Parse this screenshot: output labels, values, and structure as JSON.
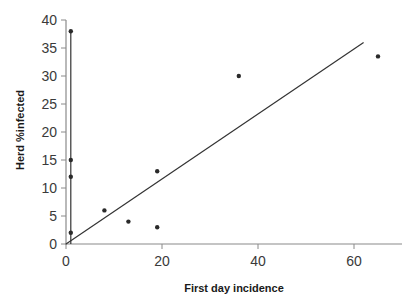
{
  "chart_data": {
    "type": "scatter",
    "title": "",
    "xlabel": "First day incidence",
    "ylabel": "Herd %infected",
    "xlim": [
      0,
      70
    ],
    "ylim": [
      0,
      40
    ],
    "xticks": [
      0,
      20,
      40,
      60
    ],
    "yticks": [
      0,
      5,
      10,
      15,
      20,
      25,
      30,
      35,
      40
    ],
    "grid": false,
    "legend": null,
    "series": [
      {
        "name": "herds",
        "kind": "scatter",
        "points": [
          {
            "x": 1,
            "y": 38
          },
          {
            "x": 1,
            "y": 15
          },
          {
            "x": 1,
            "y": 12
          },
          {
            "x": 1,
            "y": 2
          },
          {
            "x": 8,
            "y": 6
          },
          {
            "x": 13,
            "y": 4
          },
          {
            "x": 19,
            "y": 13
          },
          {
            "x": 19,
            "y": 3
          },
          {
            "x": 36,
            "y": 30
          },
          {
            "x": 65,
            "y": 33.5
          }
        ]
      },
      {
        "name": "vertical reference line",
        "kind": "line",
        "points": [
          {
            "x": 1,
            "y": 0
          },
          {
            "x": 1,
            "y": 38
          }
        ]
      },
      {
        "name": "trend line",
        "kind": "line",
        "points": [
          {
            "x": 0,
            "y": 0
          },
          {
            "x": 62,
            "y": 36
          }
        ]
      }
    ]
  }
}
